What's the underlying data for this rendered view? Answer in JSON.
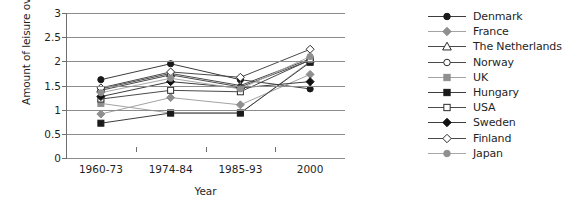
{
  "chart_data": {
    "type": "line",
    "title": "",
    "xlabel": "Year",
    "ylabel": "Amount of leisure over work",
    "categories": [
      "1960-73",
      "1974-84",
      "1985-93",
      "2000"
    ],
    "ylim": [
      0,
      3
    ],
    "ytick_labels": [
      "0",
      "0.5",
      "1",
      "1.5",
      "2",
      "2.5",
      "3"
    ],
    "ytick_values": [
      0,
      0.5,
      1,
      1.5,
      2,
      2.5,
      3
    ],
    "grid": true,
    "legend_position": "right",
    "series": [
      {
        "name": "Denmark",
        "values": [
          1.62,
          1.95,
          1.62,
          1.43
        ],
        "marker": "circle",
        "marker_fill": "#1a1a1a",
        "marker_stroke": "#1a1a1a",
        "line_color": "#3d3d3d"
      },
      {
        "name": "France",
        "values": [
          0.91,
          1.25,
          1.1,
          1.73
        ],
        "marker": "diamond",
        "marker_fill": "#8f8f8f",
        "marker_stroke": "#8f8f8f",
        "line_color": "#a3a3a3"
      },
      {
        "name": "The Netherlands",
        "values": [
          1.43,
          1.75,
          1.5,
          2.05
        ],
        "marker": "triangle",
        "marker_fill": "#ffffff",
        "marker_stroke": "#2b2b2b",
        "line_color": "#4a4a4a"
      },
      {
        "name": "Norway",
        "values": [
          1.4,
          1.72,
          1.47,
          2.02
        ],
        "marker": "circle",
        "marker_fill": "#ffffff",
        "marker_stroke": "#2b2b2b",
        "line_color": "#4a4a4a"
      },
      {
        "name": "UK",
        "values": [
          1.13,
          0.93,
          0.93,
          2.0
        ],
        "marker": "square",
        "marker_fill": "#8f8f8f",
        "marker_stroke": "#8f8f8f",
        "line_color": "#a3a3a3"
      },
      {
        "name": "Hungary",
        "values": [
          0.72,
          0.93,
          0.93,
          1.98
        ],
        "marker": "square",
        "marker_fill": "#1a1a1a",
        "marker_stroke": "#1a1a1a",
        "line_color": "#3d3d3d"
      },
      {
        "name": "USA",
        "values": [
          1.22,
          1.4,
          1.37,
          2.03
        ],
        "marker": "square",
        "marker_fill": "#ffffff",
        "marker_stroke": "#2b2b2b",
        "line_color": "#4a4a4a"
      },
      {
        "name": "Sweden",
        "values": [
          1.27,
          1.58,
          1.45,
          1.58
        ],
        "marker": "diamond",
        "marker_fill": "#111111",
        "marker_stroke": "#111111",
        "line_color": "#3d3d3d"
      },
      {
        "name": "Finland",
        "values": [
          1.45,
          1.78,
          1.67,
          2.25
        ],
        "marker": "diamond",
        "marker_fill": "#ffffff",
        "marker_stroke": "#2b2b2b",
        "line_color": "#4a4a4a"
      },
      {
        "name": "Japan",
        "values": [
          1.35,
          1.65,
          1.43,
          2.1
        ],
        "marker": "circle",
        "marker_fill": "#8f8f8f",
        "marker_stroke": "#8f8f8f",
        "line_color": "#a8a8a8"
      }
    ]
  }
}
